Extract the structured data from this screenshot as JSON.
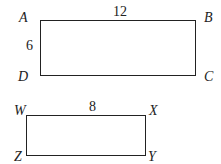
{
  "figures": [
    {
      "name": "ABCD",
      "vertices": {
        "top_left": "A",
        "top_right": "B",
        "bottom_right": "C",
        "bottom_left": "D"
      },
      "side_labels": {
        "top": "12",
        "left": "6"
      }
    },
    {
      "name": "WXYZ",
      "vertices": {
        "top_left": "W",
        "top_right": "X",
        "bottom_right": "Y",
        "bottom_left": "Z"
      },
      "side_labels": {
        "top": "8"
      }
    }
  ]
}
